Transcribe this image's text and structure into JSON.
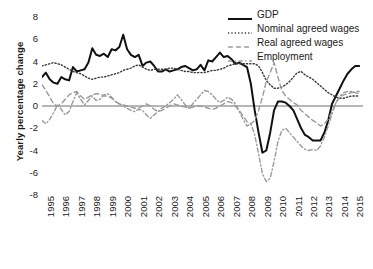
{
  "chart_data": {
    "type": "line",
    "title": "",
    "xlabel": "",
    "ylabel": "Yearly percentage change",
    "ylim": [
      -8,
      8
    ],
    "yticks": [
      8,
      6,
      4,
      2,
      0,
      -2,
      -4,
      -6,
      -8
    ],
    "xlim": [
      1995,
      2015.75
    ],
    "xticks": [
      "1995",
      "1996",
      "1997",
      "1998",
      "1999",
      "2000",
      "2001",
      "2002",
      "2003",
      "2004",
      "2005",
      "2006",
      "2007",
      "2008",
      "2009",
      "2010",
      "2011",
      "2012",
      "2013",
      "2014",
      "2015"
    ],
    "grid": false,
    "zero_line": true,
    "legend_position": "top-right",
    "x_frequency": "quarterly",
    "x": [
      1995.0,
      1995.25,
      1995.5,
      1995.75,
      1996.0,
      1996.25,
      1996.5,
      1996.75,
      1997.0,
      1997.25,
      1997.5,
      1997.75,
      1998.0,
      1998.25,
      1998.5,
      1998.75,
      1999.0,
      1999.25,
      1999.5,
      1999.75,
      2000.0,
      2000.25,
      2000.5,
      2000.75,
      2001.0,
      2001.25,
      2001.5,
      2001.75,
      2002.0,
      2002.25,
      2002.5,
      2002.75,
      2003.0,
      2003.25,
      2003.5,
      2003.75,
      2004.0,
      2004.25,
      2004.5,
      2004.75,
      2005.0,
      2005.25,
      2005.5,
      2005.75,
      2006.0,
      2006.25,
      2006.5,
      2006.75,
      2007.0,
      2007.25,
      2007.5,
      2007.75,
      2008.0,
      2008.25,
      2008.5,
      2008.75,
      2009.0,
      2009.25,
      2009.5,
      2009.75,
      2010.0,
      2010.25,
      2010.5,
      2010.75,
      2011.0,
      2011.25,
      2011.5,
      2011.75,
      2012.0,
      2012.25,
      2012.5,
      2012.75,
      2013.0,
      2013.25,
      2013.5,
      2013.75,
      2014.0,
      2014.25,
      2014.5,
      2014.75,
      2015.0,
      2015.25,
      2015.5
    ],
    "series": [
      {
        "name": "GDP",
        "style": "solid",
        "color": "#111111",
        "width": 2.0,
        "values": [
          2.6,
          3.0,
          2.4,
          2.1,
          2.0,
          2.6,
          2.4,
          2.3,
          3.5,
          3.1,
          3.2,
          3.3,
          3.9,
          5.2,
          4.6,
          4.5,
          4.7,
          4.4,
          5.1,
          5.0,
          5.3,
          6.4,
          5.1,
          4.6,
          4.4,
          4.6,
          3.6,
          3.9,
          4.0,
          3.6,
          3.1,
          3.1,
          3.3,
          3.1,
          3.2,
          3.3,
          3.5,
          3.6,
          3.4,
          3.2,
          3.3,
          3.7,
          3.2,
          4.1,
          4.0,
          4.4,
          4.8,
          4.4,
          4.5,
          4.2,
          3.8,
          3.9,
          3.7,
          3.5,
          2.0,
          -0.4,
          -2.4,
          -4.2,
          -4.0,
          -2.4,
          -0.4,
          0.4,
          0.4,
          0.3,
          0.0,
          -0.4,
          -1.2,
          -2.0,
          -2.6,
          -2.8,
          -3.1,
          -3.1,
          -3.1,
          -2.4,
          -1.3,
          0.2,
          0.9,
          1.6,
          2.3,
          2.9,
          3.3,
          3.6,
          3.6
        ]
      },
      {
        "name": "Nominal agreed wages",
        "style": "dotted",
        "color": "#3a3a3a",
        "width": 1.4,
        "values": [
          3.6,
          3.7,
          3.8,
          3.9,
          3.8,
          3.7,
          3.5,
          3.3,
          3.1,
          3.0,
          2.9,
          2.7,
          2.5,
          2.4,
          2.5,
          2.6,
          2.6,
          2.7,
          2.8,
          2.9,
          3.0,
          3.2,
          3.3,
          3.4,
          3.6,
          3.7,
          3.5,
          3.3,
          3.2,
          3.3,
          3.3,
          3.3,
          3.3,
          3.4,
          3.4,
          3.3,
          3.2,
          3.1,
          3.1,
          3.0,
          3.0,
          3.0,
          3.0,
          3.1,
          3.2,
          3.2,
          3.3,
          3.4,
          3.6,
          3.7,
          3.8,
          3.8,
          3.8,
          3.8,
          3.8,
          3.8,
          3.6,
          3.0,
          2.3,
          1.9,
          1.6,
          1.6,
          1.7,
          1.9,
          2.2,
          2.6,
          3.0,
          3.1,
          2.8,
          2.6,
          2.4,
          2.1,
          1.8,
          1.5,
          1.2,
          1.0,
          0.8,
          0.7,
          0.7,
          0.8,
          0.9,
          0.9,
          0.9
        ]
      },
      {
        "name": "Real agreed wages",
        "style": "dashed",
        "color": "#9a9a9a",
        "width": 1.4,
        "values": [
          1.9,
          1.4,
          0.8,
          0.2,
          0.0,
          0.2,
          0.6,
          1.0,
          1.2,
          1.3,
          0.9,
          0.6,
          0.8,
          1.0,
          1.1,
          1.1,
          0.9,
          0.9,
          0.7,
          0.4,
          0.2,
          0.1,
          0.0,
          -0.1,
          -0.2,
          -0.2,
          0.0,
          0.2,
          0.0,
          -0.3,
          -0.5,
          -0.4,
          -0.2,
          0.0,
          0.2,
          0.1,
          0.0,
          -0.1,
          -0.2,
          -0.1,
          0.0,
          0.0,
          -0.1,
          -0.2,
          -0.3,
          -0.2,
          0.0,
          0.2,
          0.4,
          0.3,
          0.0,
          -0.4,
          -0.9,
          -1.4,
          -1.6,
          -1.3,
          -0.4,
          0.8,
          2.2,
          3.0,
          3.9,
          2.6,
          1.4,
          0.9,
          0.6,
          0.3,
          0.1,
          -0.4,
          -0.7,
          -1.0,
          -1.3,
          -1.5,
          -1.8,
          -1.6,
          -1.2,
          -0.5,
          0.3,
          0.8,
          1.0,
          1.1,
          1.2,
          1.3,
          1.3
        ]
      },
      {
        "name": "Employment",
        "style": "dashdot",
        "color": "#9a9a9a",
        "width": 1.4,
        "values": [
          -1.3,
          -1.6,
          -1.2,
          -0.6,
          0.1,
          -0.3,
          -0.8,
          -0.5,
          0.4,
          1.2,
          0.6,
          0.1,
          0.5,
          0.9,
          0.5,
          0.6,
          1.0,
          1.1,
          0.8,
          0.4,
          0.2,
          0.0,
          -0.2,
          -0.4,
          -0.5,
          -0.3,
          -0.4,
          -0.8,
          -1.1,
          -0.8,
          -0.5,
          -0.2,
          0.0,
          0.3,
          0.6,
          1.0,
          0.6,
          0.1,
          -0.2,
          0.2,
          0.6,
          1.0,
          1.4,
          1.3,
          1.0,
          0.6,
          0.3,
          0.5,
          0.8,
          0.6,
          0.2,
          -0.5,
          -1.2,
          -1.8,
          -1.6,
          -2.6,
          -4.3,
          -6.1,
          -6.8,
          -6.5,
          -5.0,
          -3.2,
          -2.2,
          -2.0,
          -2.4,
          -2.8,
          -3.2,
          -3.6,
          -3.9,
          -4.0,
          -3.9,
          -4.0,
          -3.6,
          -2.8,
          -1.8,
          -0.7,
          0.3,
          0.9,
          1.2,
          1.3,
          1.3,
          1.2,
          1.1
        ]
      }
    ]
  },
  "legend": {
    "entries": [
      {
        "label": "GDP"
      },
      {
        "label": "Nominal agreed wages"
      },
      {
        "label": "Real agreed wages"
      },
      {
        "label": "Employment"
      }
    ]
  }
}
